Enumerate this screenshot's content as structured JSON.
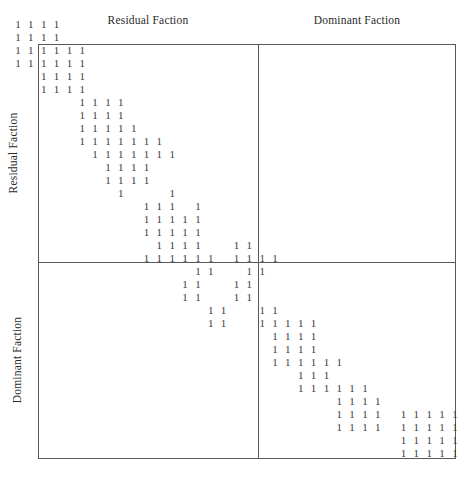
{
  "figure": {
    "type": "block-diagonal-incidence-matrix",
    "top_labels": {
      "residual": "Residual Faction",
      "dominant": "Dominant Faction"
    },
    "side_labels": {
      "residual": "Residual Faction",
      "dominant": "Dominant Faction"
    },
    "cell_symbol": "1",
    "colors": {
      "cell": "#3b3b40",
      "border": "#555a5e",
      "background": "#ffffff"
    },
    "geometry": {
      "box_left": 38,
      "box_top": 44,
      "box_width": 418,
      "box_height": 415,
      "divider_x": 258,
      "divider_y": 262,
      "col_step": 12.85,
      "row_step": 13.0,
      "origin_x": 13,
      "origin_y": 18
    }
  },
  "chart_data": {
    "type": "heatmap",
    "title": "",
    "xlabel": "",
    "ylabel": "",
    "legend": [],
    "grid": false,
    "axis_partitions": {
      "columns": [
        {
          "name": "Residual Faction",
          "start_col": 0,
          "end_col": 16
        },
        {
          "name": "Dominant Faction",
          "start_col": 17,
          "end_col": 34
        }
      ],
      "rows": [
        {
          "name": "Residual Faction",
          "start_row": 0,
          "end_row": 16
        },
        {
          "name": "Dominant Faction",
          "start_row": 17,
          "end_row": 33
        }
      ]
    },
    "n_rows": 34,
    "n_cols": 35,
    "cell_value": 1,
    "rows": [
      {
        "row": 0,
        "cols": [
          0,
          1,
          2,
          3
        ]
      },
      {
        "row": 1,
        "cols": [
          0,
          1,
          2,
          3
        ]
      },
      {
        "row": 2,
        "cols": [
          0,
          1,
          2,
          3,
          4,
          5
        ]
      },
      {
        "row": 3,
        "cols": [
          0,
          1,
          2,
          3,
          4,
          5
        ]
      },
      {
        "row": 4,
        "cols": [
          2,
          3,
          4,
          5
        ]
      },
      {
        "row": 5,
        "cols": [
          2,
          3,
          4,
          5
        ]
      },
      {
        "row": 6,
        "cols": [
          5,
          6,
          7,
          8
        ]
      },
      {
        "row": 7,
        "cols": [
          5,
          6,
          7,
          8
        ]
      },
      {
        "row": 8,
        "cols": [
          5,
          6,
          7,
          8,
          9
        ]
      },
      {
        "row": 9,
        "cols": [
          5,
          6,
          7,
          8,
          9,
          10,
          11
        ]
      },
      {
        "row": 10,
        "cols": [
          6,
          7,
          8,
          9,
          10,
          11,
          12
        ]
      },
      {
        "row": 11,
        "cols": [
          7,
          8,
          9,
          10
        ]
      },
      {
        "row": 12,
        "cols": [
          7,
          8,
          9,
          10
        ]
      },
      {
        "row": 13,
        "cols": [
          8,
          12
        ]
      },
      {
        "row": 14,
        "cols": [
          10,
          11,
          12,
          14
        ]
      },
      {
        "row": 15,
        "cols": [
          10,
          11,
          12,
          13,
          14
        ]
      },
      {
        "row": 16,
        "cols": [
          10,
          11,
          12,
          13,
          14
        ]
      },
      {
        "row": 17,
        "cols": [
          11,
          12,
          13,
          14,
          17,
          18
        ]
      },
      {
        "row": 18,
        "cols": [
          10,
          11,
          12,
          13,
          14,
          15,
          17,
          18,
          19,
          20
        ]
      },
      {
        "row": 19,
        "cols": [
          14,
          15,
          18,
          19
        ]
      },
      {
        "row": 20,
        "cols": [
          13,
          14,
          17,
          18
        ]
      },
      {
        "row": 21,
        "cols": [
          13,
          14,
          17,
          18
        ]
      },
      {
        "row": 22,
        "cols": [
          15,
          16,
          19,
          20
        ]
      },
      {
        "row": 23,
        "cols": [
          15,
          16,
          19,
          20,
          21,
          22,
          23
        ]
      },
      {
        "row": 24,
        "cols": [
          20,
          21,
          22,
          23
        ]
      },
      {
        "row": 25,
        "cols": [
          20,
          21,
          22,
          23
        ]
      },
      {
        "row": 26,
        "cols": [
          20,
          21,
          22,
          23,
          24,
          25
        ]
      },
      {
        "row": 27,
        "cols": [
          22,
          23,
          24
        ]
      },
      {
        "row": 28,
        "cols": [
          22,
          23,
          24,
          25,
          26,
          27
        ]
      },
      {
        "row": 29,
        "cols": [
          25,
          26,
          27,
          28
        ]
      },
      {
        "row": 30,
        "cols": [
          25,
          26,
          27,
          28,
          30,
          31,
          32,
          33,
          34
        ]
      },
      {
        "row": 31,
        "cols": [
          25,
          26,
          27,
          28,
          30,
          31,
          32,
          33,
          34
        ]
      },
      {
        "row": 32,
        "cols": [
          30,
          31,
          32,
          33,
          34
        ]
      },
      {
        "row": 33,
        "cols": [
          30,
          31,
          32,
          33,
          34
        ]
      }
    ]
  }
}
